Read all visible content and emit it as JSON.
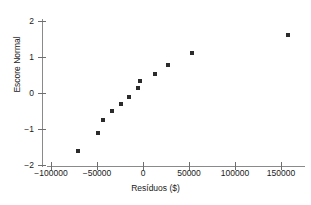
{
  "title_remnant": "",
  "chart_data": {
    "type": "scatter",
    "title": "",
    "xlabel": "Resíduos ($)",
    "ylabel": "Escore Normal",
    "xlim": [
      -120000,
      175000
    ],
    "ylim": [
      -2.35,
      2.25
    ],
    "grid": false,
    "legend": null,
    "xticks": [
      -100000,
      -50000,
      0,
      50000,
      100000,
      150000
    ],
    "xtick_labels": [
      "−100000",
      "−50000",
      "0",
      "50000",
      "100000",
      "150000"
    ],
    "yticks": [
      -2,
      -1,
      0,
      1,
      2
    ],
    "ytick_labels": [
      "−2",
      "−1",
      "0",
      "1",
      "2"
    ],
    "marker": "square",
    "marker_color": "#2b2b2b",
    "marker_size": 4,
    "points": [
      {
        "x": -71000,
        "y": -1.61
      },
      {
        "x": -49000,
        "y": -1.11
      },
      {
        "x": -44000,
        "y": -0.75
      },
      {
        "x": -34000,
        "y": -0.5
      },
      {
        "x": -24000,
        "y": -0.31
      },
      {
        "x": -15500,
        "y": -0.1
      },
      {
        "x": -5500,
        "y": 0.14
      },
      {
        "x": -3000,
        "y": 0.34
      },
      {
        "x": 13000,
        "y": 0.53
      },
      {
        "x": 27000,
        "y": 0.78
      },
      {
        "x": 53000,
        "y": 1.12
      },
      {
        "x": 158000,
        "y": 1.6
      }
    ]
  }
}
